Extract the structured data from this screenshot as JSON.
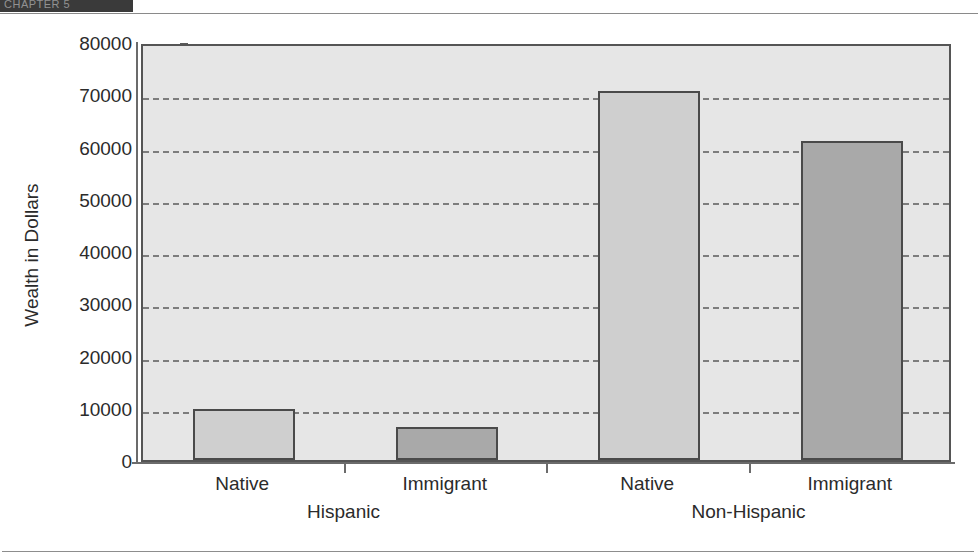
{
  "header": {
    "tab_label": "CHAPTER 5"
  },
  "chart_data": {
    "type": "bar",
    "title": "",
    "subtitle": "",
    "xlabel": "",
    "ylabel": "Wealth in Dollars",
    "ylim": [
      0,
      80000
    ],
    "ytick_labels": [
      "0",
      "10000",
      "20000",
      "30000",
      "40000",
      "50000",
      "60000",
      "70000",
      "80000"
    ],
    "ytick_values": [
      0,
      10000,
      20000,
      30000,
      40000,
      50000,
      60000,
      70000,
      80000
    ],
    "grid": "horizontal-dashed",
    "legend": "none",
    "categories": [
      "Native",
      "Immigrant",
      "Native",
      "Immigrant"
    ],
    "groups": [
      "Hispanic",
      "Non-Hispanic"
    ],
    "values": [
      9700,
      6400,
      70700,
      61000
    ],
    "bars": [
      {
        "label": "Native",
        "group": "Hispanic",
        "value": 9700,
        "color": "#cfcfcf"
      },
      {
        "label": "Immigrant",
        "group": "Hispanic",
        "value": 6400,
        "color": "#a9a9a9"
      },
      {
        "label": "Native",
        "group": "Non-Hispanic",
        "value": 70700,
        "color": "#cfcfcf"
      },
      {
        "label": "Immigrant",
        "group": "Non-Hispanic",
        "value": 61000,
        "color": "#a9a9a9"
      }
    ],
    "colors": {
      "native_bar": "#cfcfcf",
      "immigrant_bar": "#a9a9a9",
      "bar_border": "#4a4a4a",
      "plot_background": "#e6e6e6",
      "gridline": "#7d7d7d",
      "axis": "#6b6b6b",
      "text": "#2b2b2b"
    }
  }
}
